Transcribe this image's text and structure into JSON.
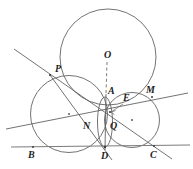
{
  "figure": {
    "background_color": "#ffffff",
    "stroke_color": "#5a5a5a",
    "label_color": "#1d1d1d",
    "width": 193,
    "height": 169,
    "points": [
      {
        "id": "P",
        "label": "P",
        "x": 50,
        "y": 75,
        "label_x": 55,
        "label_y": 64,
        "marked": true
      },
      {
        "id": "O",
        "label": "O",
        "x": 108,
        "y": 57,
        "label_x": 104,
        "label_y": 50,
        "marked": false
      },
      {
        "id": "A",
        "label": "A",
        "x": 106,
        "y": 97,
        "label_x": 108,
        "label_y": 86,
        "marked": false
      },
      {
        "id": "M",
        "label": "M",
        "x": 152,
        "y": 97,
        "label_x": 146,
        "label_y": 85,
        "marked": true
      },
      {
        "id": "E",
        "label": "E",
        "x": 124,
        "y": 103,
        "label_x": 120,
        "label_y": 95,
        "marked": false
      },
      {
        "id": "N",
        "label": "N",
        "x": 88,
        "y": 121,
        "label_x": 84,
        "label_y": 122,
        "marked": false
      },
      {
        "id": "Q",
        "label": "Q",
        "x": 110,
        "y": 123,
        "label_x": 110,
        "label_y": 121,
        "marked": false
      },
      {
        "id": "B",
        "label": "B",
        "x": 33,
        "y": 147,
        "label_x": 28,
        "label_y": 151,
        "marked": true
      },
      {
        "id": "D",
        "label": "D",
        "x": 105,
        "y": 147,
        "label_x": 101,
        "label_y": 152,
        "marked": true
      },
      {
        "id": "C",
        "label": "C",
        "x": 154,
        "y": 146,
        "label_x": 150,
        "label_y": 151,
        "marked": true
      }
    ],
    "circles": [
      {
        "id": "circumcircle-O",
        "cx": 108,
        "cy": 57,
        "r": 48,
        "center_dot": false
      },
      {
        "id": "circle-left-PBD",
        "cx": 69,
        "cy": 114,
        "r": 38.5,
        "center_dot": true
      },
      {
        "id": "circle-right-DCM",
        "cx": 132,
        "cy": 120,
        "r": 27.5,
        "center_dot": true
      },
      {
        "id": "circle-small-AD",
        "cx": 105,
        "cy": 122,
        "r": 25,
        "center_dot": false
      }
    ],
    "lines": [
      {
        "id": "line-BC-base",
        "x1": 11,
        "y1": 147,
        "x2": 190,
        "y2": 145
      },
      {
        "id": "line-through-P-C",
        "x1": 14,
        "y1": 49,
        "x2": 172,
        "y2": 159
      },
      {
        "id": "line-B-through-M",
        "x1": 6,
        "y1": 129,
        "x2": 188,
        "y2": 93
      },
      {
        "id": "line-P-to-D",
        "x1": 50,
        "y1": 75,
        "x2": 112,
        "y2": 160
      },
      {
        "id": "line-A-D-vertical",
        "x1": 106,
        "y1": 94,
        "x2": 105,
        "y2": 150
      }
    ],
    "dashed_lines": [
      {
        "id": "dashed-O-to-A",
        "x1": 107,
        "y1": 62,
        "x2": 106,
        "y2": 94
      }
    ],
    "arrows": [
      {
        "id": "arrow-E-to-center",
        "x1": 123,
        "y1": 104,
        "x2": 110,
        "y2": 112
      }
    ]
  }
}
